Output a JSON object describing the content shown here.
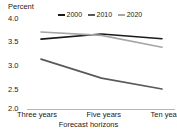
{
  "axis": {
    "y_unit_label": "Percent",
    "y_ticks": [
      "4.0",
      "3.5",
      "3.0",
      "2.5",
      "2.0"
    ],
    "x_ticks": [
      "Three years",
      "Five years",
      "Ten years"
    ],
    "x_title": "Forecast horizons"
  },
  "legend": {
    "items": [
      {
        "label": "2000",
        "color": "#1a1a1a"
      },
      {
        "label": "2010",
        "color": "#595959"
      },
      {
        "label": "2020",
        "color": "#a6a6a6"
      }
    ]
  },
  "chart_data": {
    "type": "line",
    "title": "",
    "subtitle": "",
    "xlabel": "Forecast horizons",
    "ylabel": "Percent",
    "categories": [
      "Three years",
      "Five years",
      "Ten years"
    ],
    "ylim": [
      2.0,
      4.0
    ],
    "ytick_values": [
      2.0,
      2.5,
      3.0,
      3.5,
      4.0
    ],
    "grid": false,
    "legend_position": "top-center",
    "series": [
      {
        "name": "2000",
        "color": "#1a1a1a",
        "values": [
          3.47,
          3.58,
          3.48
        ]
      },
      {
        "name": "2010",
        "color": "#595959",
        "values": [
          3.05,
          2.65,
          2.42
        ]
      },
      {
        "name": "2020",
        "color": "#a6a6a6",
        "values": [
          3.62,
          3.55,
          3.3
        ]
      }
    ]
  }
}
